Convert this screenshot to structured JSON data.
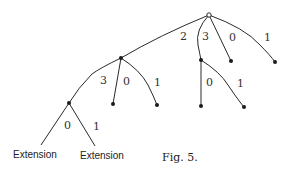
{
  "figure": {
    "caption": "Fig. 5.",
    "root": {
      "type": "open-node"
    },
    "edge_labels": {
      "root_2": "2",
      "root_3": "3",
      "root_0": "0",
      "root_1": "1",
      "a_3": "3",
      "a_0": "0",
      "a_1": "1",
      "b_0": "0",
      "b_1": "1",
      "e_0": "0",
      "e_1": "1"
    },
    "extension_labels": [
      "Extension",
      "Extension"
    ]
  },
  "colors": {
    "line": "#2a2a2a",
    "node": "#1a1a1a",
    "background": "#ffffff"
  }
}
